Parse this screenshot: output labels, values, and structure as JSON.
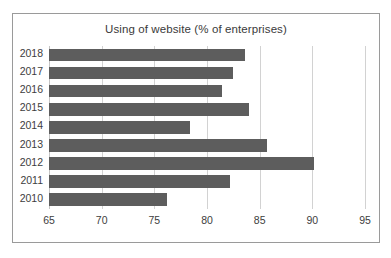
{
  "chart_data": {
    "type": "bar",
    "orientation": "horizontal",
    "title": "Using of website (% of enterprises)",
    "xlabel": "",
    "ylabel": "",
    "categories": [
      "2018",
      "2017",
      "2016",
      "2015",
      "2014",
      "2013",
      "2012",
      "2011",
      "2010"
    ],
    "values": [
      83.6,
      82.5,
      81.4,
      84.0,
      78.4,
      85.7,
      90.2,
      82.2,
      76.2
    ],
    "xlim": [
      65,
      95
    ],
    "xticks": [
      65,
      70,
      75,
      80,
      85,
      90,
      95
    ],
    "xtick_labels": [
      "65",
      "70",
      "75",
      "80",
      "85",
      "90",
      "95"
    ],
    "grid": true,
    "grid_axis": "x",
    "legend": false,
    "bar_color": "#5d5d5d",
    "gridline_color": "#d2d2d2",
    "border_color": "#9a9a9a",
    "background_color": "#ffffff",
    "text_color": "#3d3d3d"
  }
}
